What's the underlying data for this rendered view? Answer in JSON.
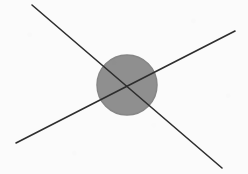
{
  "figure": {
    "title": "Two intersecting straight lines crossing a shaded circle",
    "canvas": {
      "width": 248,
      "height": 174,
      "background_color": "#fbfbfb"
    },
    "circle": {
      "label": "shaded circle",
      "center_x": 127,
      "center_y": 85,
      "radius": 30,
      "fill_color": "#8f8f8f",
      "stroke_color": "#868686",
      "stroke_width": 1.5
    },
    "lines": [
      {
        "label": "descending line",
        "x1": 32,
        "y1": 5,
        "x2": 222,
        "y2": 168,
        "color": "#2e2e2e",
        "width": 1.6
      },
      {
        "label": "ascending line",
        "x1": 16,
        "y1": 143,
        "x2": 235,
        "y2": 31,
        "color": "#2e2e2e",
        "width": 1.6
      }
    ],
    "intersection": {
      "label": "intersection point",
      "x": 126,
      "y": 86
    }
  }
}
